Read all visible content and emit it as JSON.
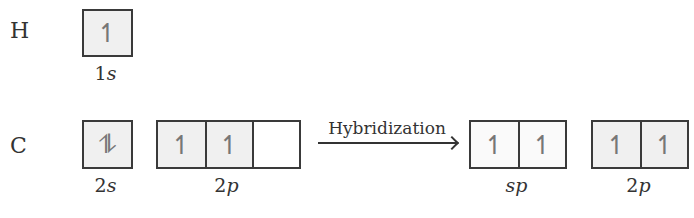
{
  "rows": {
    "hydrogen": {
      "element": "H",
      "orbitals": [
        {
          "label": "1",
          "label_italic": "s",
          "electrons": [
            "↿"
          ]
        }
      ]
    },
    "carbon": {
      "element": "C",
      "before": [
        {
          "label": "2",
          "label_italic": "s",
          "boxes": [
            "⥮"
          ]
        },
        {
          "label": "2",
          "label_italic": "p",
          "boxes": [
            "↿",
            "↿",
            ""
          ]
        }
      ],
      "process": "Hybridization",
      "after": [
        {
          "label": "",
          "label_italic": "sp",
          "boxes": [
            "↿",
            "↿"
          ]
        },
        {
          "label": "2",
          "label_italic": "p",
          "boxes": [
            "↿",
            "↿"
          ]
        }
      ]
    }
  },
  "colors": {
    "box_border": "#3a3a3a",
    "filled_shade": "#f0f0f0",
    "arrow_glyph": "#777777"
  }
}
